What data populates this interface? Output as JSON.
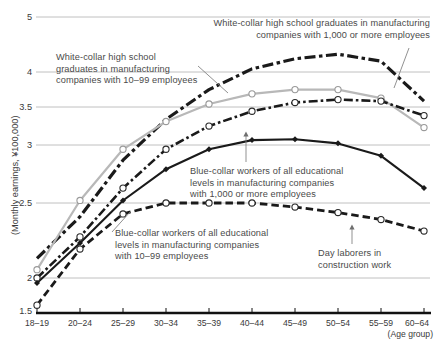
{
  "chart_data": {
    "type": "line",
    "title": "",
    "xlabel": "(Age group)",
    "ylabel": "(Monthly earnings, ¥100,000)",
    "categories": [
      "18–19",
      "20–24",
      "25–29",
      "30–34",
      "35–39",
      "40–44",
      "45–49",
      "50–54",
      "55–59",
      "60–64"
    ],
    "yticks": [
      "1.5",
      "2",
      "2.5",
      "3",
      "3.5",
      "4",
      "5"
    ],
    "ylim": [
      1.5,
      5
    ],
    "grid": true,
    "scale": "log",
    "legend_position": "annotations-inline",
    "series": [
      {
        "name": "White-collar high school graduates in manufacturing companies with 1,000 or more employees",
        "style": "dash-dot-thick",
        "color": "#1a1a1a",
        "marker": "none",
        "values": [
          2.12,
          2.4,
          2.86,
          3.33,
          3.74,
          4.05,
          4.22,
          4.3,
          4.18,
          3.58
        ]
      },
      {
        "name": "White-collar high school graduates in manufacturing companies with 10–99 employees",
        "style": "solid-gray",
        "color": "#b8b8b8",
        "marker": "open-circle",
        "values": [
          2.05,
          2.52,
          2.96,
          3.3,
          3.54,
          3.68,
          3.74,
          3.74,
          3.62,
          3.22
        ]
      },
      {
        "name": "Blue-collar workers of all educational levels in manufacturing companies with 1,000 or more employees",
        "style": "dash-dot",
        "color": "#1a1a1a",
        "marker": "open-circle",
        "values": [
          2.0,
          2.26,
          2.62,
          2.96,
          3.24,
          3.44,
          3.56,
          3.6,
          3.58,
          3.38
        ]
      },
      {
        "name": "Blue-collar workers of all educational levels in manufacturing companies with 10–99 employees",
        "style": "solid-black",
        "color": "#1a1a1a",
        "marker": "filled-diamond",
        "values": [
          1.92,
          2.22,
          2.52,
          2.78,
          2.96,
          3.06,
          3.07,
          3.02,
          2.9,
          2.62
        ]
      },
      {
        "name": "Day laborers in construction work",
        "style": "dashed-thick",
        "color": "#1a1a1a",
        "marker": "open-circle",
        "values": [
          1.6,
          2.18,
          2.42,
          2.5,
          2.5,
          2.5,
          2.47,
          2.43,
          2.38,
          2.3
        ]
      }
    ],
    "annotations": [
      {
        "id": "ann-white-1000",
        "text": "White-collar high school graduates in manufacturing\ncompanies with 1,000 or more employees"
      },
      {
        "id": "ann-white-1099",
        "text": "White-collar high school\ngraduates in manufacturing\ncompanies with 10–99 employees"
      },
      {
        "id": "ann-blue-1000",
        "text": "Blue-collar workers of all educational\nlevels in manufacturing companies\nwith 1,000 or more employees"
      },
      {
        "id": "ann-blue-1099",
        "text": "Blue-collar workers of all educational\nlevels in manufacturing companies\nwith 10–99 employees"
      },
      {
        "id": "ann-day-laborers",
        "text": "Day laborers in\nconstruction work"
      }
    ]
  },
  "axis": {
    "y_label": "(Monthly earnings, ¥100,000)",
    "x_label": "(Age group)",
    "yticks": [
      "5",
      "4",
      "3.5",
      "3",
      "2.5",
      "2",
      "1.5"
    ],
    "xticks": [
      "18–19",
      "20–24",
      "25–29",
      "30–34",
      "35–39",
      "40–44",
      "45–49",
      "50–54",
      "55–59",
      "60–64"
    ]
  }
}
